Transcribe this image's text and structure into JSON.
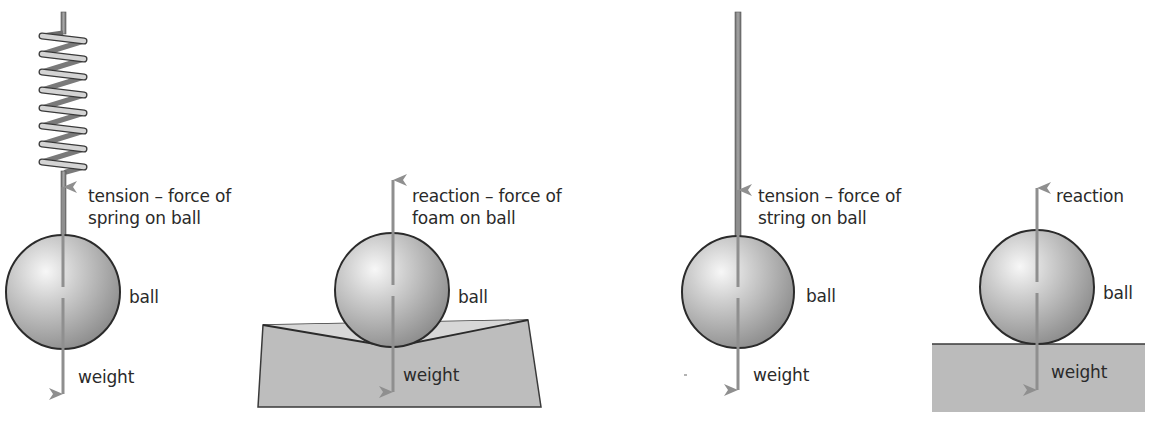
{
  "colors": {
    "arrow": "#8f8f8f",
    "outline": "#2b2b2b",
    "ball_light": "#f4f4f4",
    "ball_dark": "#8e8e8e",
    "surface": "#b9b9b9",
    "surface_light": "#d6d6d6",
    "spring_light": "#d0d0d0",
    "spring_dark": "#7a7a7a",
    "string": "#8a8a8a",
    "text": "#2a2a2a"
  },
  "panels": [
    {
      "id": "spring",
      "labels": {
        "force_up_line1": "tension – force of",
        "force_up_line2": "spring on ball",
        "object": "ball",
        "force_down": "weight"
      }
    },
    {
      "id": "foam",
      "labels": {
        "force_up_line1": "reaction – force of",
        "force_up_line2": "foam on ball",
        "object": "ball",
        "force_down": "weight"
      }
    },
    {
      "id": "string",
      "labels": {
        "force_up_line1": "tension – force of",
        "force_up_line2": "string on ball",
        "object": "ball",
        "force_down": "weight"
      }
    },
    {
      "id": "surface",
      "labels": {
        "force_up_line1": "reaction",
        "object": "ball",
        "force_down": "weight"
      }
    }
  ]
}
